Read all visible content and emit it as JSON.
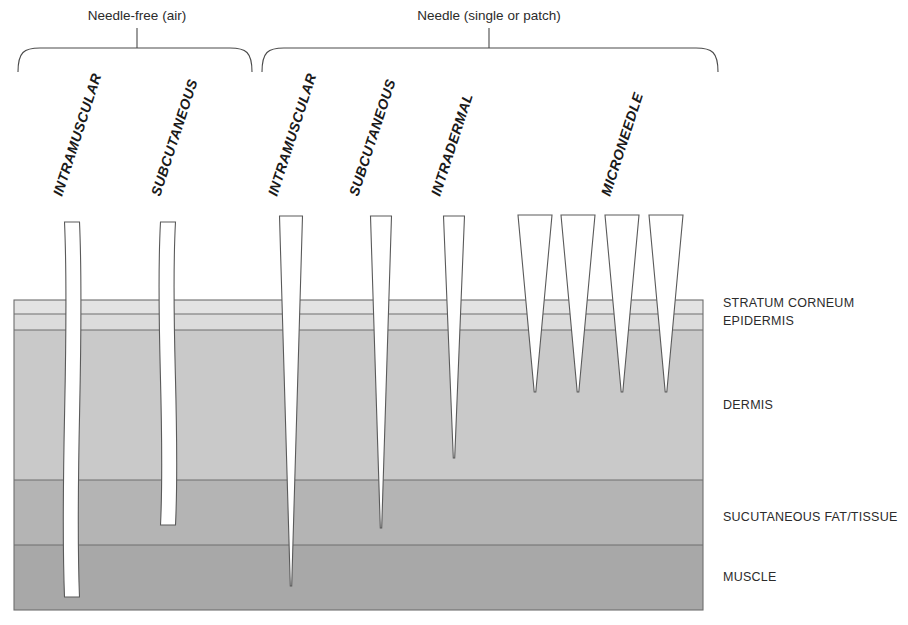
{
  "diagram": {
    "title_groups": [
      {
        "label": "Needle-free (air)",
        "center_x": 137,
        "brace_x1": 18,
        "brace_x2": 252
      },
      {
        "label": "Needle (single or patch)",
        "center_x": 489,
        "brace_x1": 262,
        "brace_x2": 718
      }
    ],
    "device_labels": [
      {
        "text": "INTRAMUSCULAR",
        "x": 62,
        "y": 197
      },
      {
        "text": "SUBCUTANEOUS",
        "x": 160,
        "y": 197
      },
      {
        "text": "INTRAMUSCULAR",
        "x": 277,
        "y": 197
      },
      {
        "text": "SUBCUTANEOUS",
        "x": 358,
        "y": 197
      },
      {
        "text": "INTRADERMAL",
        "x": 440,
        "y": 197
      },
      {
        "text": "MICRONEEDLE",
        "x": 610,
        "y": 197
      }
    ],
    "label_rotation_deg": -72,
    "skin": {
      "x": 14,
      "width": 689,
      "top": 300,
      "bottom": 610,
      "layers": [
        {
          "name": "STRATUM CORNEUM",
          "label": "STRATUM CORNEUM",
          "y_top": 300,
          "y_bottom": 314,
          "color": "#e3e3e3"
        },
        {
          "name": "EPIDERMIS",
          "label": "EPIDERMIS",
          "y_top": 314,
          "y_bottom": 330,
          "color": "#dcdcdc"
        },
        {
          "name": "DERMIS",
          "label": "DERMIS",
          "y_top": 330,
          "y_bottom": 480,
          "color": "#c9c9c9"
        },
        {
          "name": "SUCUTANEOUS FAT/TISSUE",
          "label": "SUCUTANEOUS FAT/TISSUE",
          "y_top": 480,
          "y_bottom": 545,
          "color": "#b4b4b4"
        },
        {
          "name": "MUSCLE",
          "label": "MUSCLE",
          "y_top": 545,
          "y_bottom": 610,
          "color": "#a8a8a8"
        }
      ],
      "label_x": 723,
      "label_positions": [
        {
          "text": "STRATUM CORNEUM",
          "y": 307
        },
        {
          "text": "EPIDERMIS",
          "y": 325
        },
        {
          "text": "DERMIS",
          "y": 409
        },
        {
          "text": "SUCUTANEOUS FAT/TISSUE",
          "y": 521
        },
        {
          "text": "MUSCLE",
          "y": 581
        }
      ]
    },
    "injections": [
      {
        "name": "air-intramuscular",
        "type": "jet",
        "group": "needle-free",
        "x": 72,
        "top": 222,
        "tip_y": 597,
        "width": 15,
        "reaches_layer": "MUSCLE"
      },
      {
        "name": "air-subcutaneous",
        "type": "jet",
        "group": "needle-free",
        "x": 168,
        "top": 222,
        "tip_y": 525,
        "width": 15,
        "reaches_layer": "SUCUTANEOUS FAT/TISSUE"
      },
      {
        "name": "needle-intramuscular",
        "type": "needle",
        "group": "needle",
        "x": 291,
        "top": 216,
        "tip_y": 586,
        "width": 23,
        "reaches_layer": "MUSCLE"
      },
      {
        "name": "needle-subcutaneous",
        "type": "needle",
        "group": "needle",
        "x": 381,
        "top": 216,
        "tip_y": 528,
        "width": 21,
        "reaches_layer": "SUCUTANEOUS FAT/TISSUE"
      },
      {
        "name": "needle-intradermal",
        "type": "needle",
        "group": "needle",
        "x": 454,
        "top": 216,
        "tip_y": 458,
        "width": 21,
        "reaches_layer": "DERMIS"
      },
      {
        "name": "microneedle-1",
        "type": "microneedle",
        "group": "needle",
        "x": 535,
        "top": 215,
        "tip_y": 392,
        "width": 34,
        "reaches_layer": "DERMIS"
      },
      {
        "name": "microneedle-2",
        "type": "microneedle",
        "group": "needle",
        "x": 578,
        "top": 215,
        "tip_y": 392,
        "width": 34,
        "reaches_layer": "DERMIS"
      },
      {
        "name": "microneedle-3",
        "type": "microneedle",
        "group": "needle",
        "x": 622,
        "top": 215,
        "tip_y": 392,
        "width": 34,
        "reaches_layer": "DERMIS"
      },
      {
        "name": "microneedle-4",
        "type": "microneedle",
        "group": "needle",
        "x": 666,
        "top": 215,
        "tip_y": 392,
        "width": 34,
        "reaches_layer": "DERMIS"
      }
    ],
    "colors": {
      "stroke": "#6e6e6e",
      "text": "#2b2b2b",
      "background": "#ffffff",
      "needle_fill": "#ffffff"
    }
  }
}
